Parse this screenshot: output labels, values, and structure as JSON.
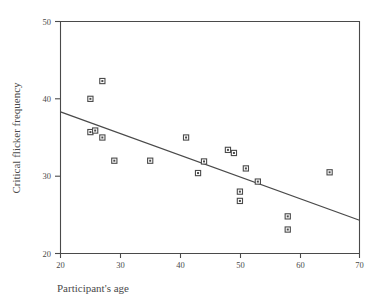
{
  "chart_data": {
    "type": "scatter",
    "title": "",
    "xlabel": "Participant's age",
    "ylabel": "Critical flicker frequency",
    "xlim": [
      20,
      70
    ],
    "ylim": [
      20,
      50
    ],
    "xticks": [
      20,
      30,
      40,
      50,
      60,
      70
    ],
    "yticks": [
      20,
      30,
      40,
      50
    ],
    "grid": false,
    "legend": null,
    "marker": "open-square-with-center-dot",
    "series": [
      {
        "name": "participants",
        "points": [
          {
            "x": 25.0,
            "y": 40.0
          },
          {
            "x": 27.0,
            "y": 42.3
          },
          {
            "x": 25.0,
            "y": 35.7
          },
          {
            "x": 25.8,
            "y": 35.9
          },
          {
            "x": 27.0,
            "y": 35.0
          },
          {
            "x": 29.0,
            "y": 32.0
          },
          {
            "x": 35.0,
            "y": 32.0
          },
          {
            "x": 41.0,
            "y": 35.0
          },
          {
            "x": 43.0,
            "y": 30.4
          },
          {
            "x": 44.0,
            "y": 31.9
          },
          {
            "x": 48.0,
            "y": 33.4
          },
          {
            "x": 49.0,
            "y": 33.0
          },
          {
            "x": 50.0,
            "y": 28.0
          },
          {
            "x": 50.0,
            "y": 26.8
          },
          {
            "x": 51.0,
            "y": 31.0
          },
          {
            "x": 53.0,
            "y": 29.3
          },
          {
            "x": 58.0,
            "y": 24.8
          },
          {
            "x": 58.0,
            "y": 23.1
          },
          {
            "x": 65.0,
            "y": 30.5
          }
        ]
      }
    ],
    "trend_line": {
      "name": "linear-fit",
      "x_start": 20,
      "y_start": 38.3,
      "x_end": 70,
      "y_end": 24.3
    }
  },
  "axes": {
    "y_tick_labels": [
      "50",
      "40",
      "30",
      "20"
    ],
    "x_tick_labels": [
      "20",
      "30",
      "40",
      "50",
      "60",
      "70"
    ],
    "x_axis_title": "Participant's age",
    "y_axis_title": "Critical flicker frequency"
  }
}
